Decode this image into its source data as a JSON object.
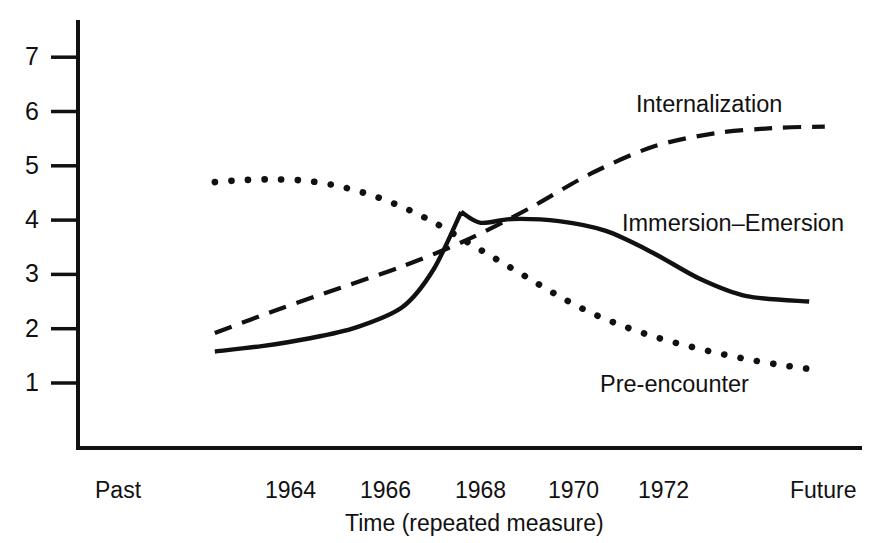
{
  "chart_data": {
    "type": "line",
    "title": "",
    "xlabel": "Time (repeated measure)",
    "ylabel": "",
    "xlim": [
      0,
      1
    ],
    "ylim": [
      0,
      7.6
    ],
    "grid": false,
    "legend_position": "inline-annotations",
    "x_tick_labels": [
      "Past",
      "1964",
      "1966",
      "1968",
      "1970",
      "1972",
      "Future"
    ],
    "y_tick_labels": [
      "1",
      "2",
      "3",
      "4",
      "5",
      "6",
      "7"
    ],
    "y_ticks": [
      1,
      2,
      3,
      4,
      5,
      6,
      7
    ],
    "series": [
      {
        "name": "Pre-encounter",
        "style": "dotted",
        "color": "#111111",
        "x": [
          0.175,
          0.215,
          0.255,
          0.295,
          0.335,
          0.375,
          0.415,
          0.455,
          0.495,
          0.535,
          0.575,
          0.615,
          0.655,
          0.695,
          0.735,
          0.775,
          0.815,
          0.855,
          0.895,
          0.935
        ],
        "values": [
          4.7,
          4.74,
          4.75,
          4.72,
          4.62,
          4.46,
          4.24,
          3.96,
          3.62,
          3.28,
          2.94,
          2.6,
          2.3,
          2.06,
          1.86,
          1.7,
          1.56,
          1.44,
          1.34,
          1.26
        ]
      },
      {
        "name": "Immersion–Emersion",
        "style": "solid",
        "color": "#111111",
        "x": [
          0.175,
          0.235,
          0.295,
          0.355,
          0.415,
          0.455,
          0.49,
          0.515,
          0.555,
          0.615,
          0.675,
          0.735,
          0.795,
          0.855,
          0.935
        ],
        "values": [
          1.58,
          1.68,
          1.82,
          2.02,
          2.4,
          3.1,
          4.15,
          3.95,
          4.02,
          3.98,
          3.8,
          3.4,
          2.92,
          2.6,
          2.5
        ]
      },
      {
        "name": "Internalization",
        "style": "dashed",
        "color": "#111111",
        "x": [
          0.175,
          0.255,
          0.335,
          0.415,
          0.495,
          0.575,
          0.655,
          0.735,
          0.815,
          0.895,
          0.955
        ],
        "values": [
          1.92,
          2.35,
          2.75,
          3.15,
          3.62,
          4.2,
          4.85,
          5.35,
          5.6,
          5.7,
          5.72
        ]
      }
    ],
    "annotations": [
      {
        "text": "Internalization",
        "x": 0.72,
        "y": 5.98
      },
      {
        "text": "Immersion–Emersion",
        "x": 0.79,
        "y": 4.02
      },
      {
        "text": "Pre-encounter",
        "x": 0.705,
        "y": 1.12
      }
    ]
  },
  "axis": {
    "x_title": "Time (repeated measure)"
  },
  "colors": {
    "ink": "#111111",
    "background": "#ffffff"
  }
}
